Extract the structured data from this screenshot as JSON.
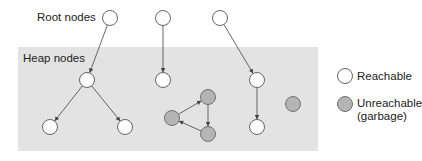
{
  "diagram": {
    "labels": {
      "root_nodes": "Root nodes",
      "heap_nodes": "Heap nodes"
    },
    "legend": {
      "reachable": "Reachable",
      "unreachable_line1": "Unreachable",
      "unreachable_line2": "(garbage)"
    },
    "colors": {
      "reachable_fill": "#ffffff",
      "unreachable_fill": "#b4b4b4",
      "heap_background": "#e3e3e3",
      "stroke": "#555555"
    },
    "nodes": [
      {
        "id": "r1",
        "type": "root",
        "reachable": true,
        "x": 110,
        "y": 18
      },
      {
        "id": "r2",
        "type": "root",
        "reachable": true,
        "x": 163,
        "y": 18
      },
      {
        "id": "r3",
        "type": "root",
        "reachable": true,
        "x": 220,
        "y": 18
      },
      {
        "id": "h1",
        "type": "heap",
        "reachable": true,
        "x": 87,
        "y": 80
      },
      {
        "id": "h2",
        "type": "heap",
        "reachable": true,
        "x": 50,
        "y": 127
      },
      {
        "id": "h3",
        "type": "heap",
        "reachable": true,
        "x": 125,
        "y": 127
      },
      {
        "id": "h4",
        "type": "heap",
        "reachable": true,
        "x": 163,
        "y": 80
      },
      {
        "id": "h5",
        "type": "heap",
        "reachable": true,
        "x": 257,
        "y": 80
      },
      {
        "id": "h6",
        "type": "heap",
        "reachable": true,
        "x": 257,
        "y": 127
      },
      {
        "id": "g1",
        "type": "heap",
        "reachable": false,
        "x": 208,
        "y": 97
      },
      {
        "id": "g2",
        "type": "heap",
        "reachable": false,
        "x": 172,
        "y": 118
      },
      {
        "id": "g3",
        "type": "heap",
        "reachable": false,
        "x": 208,
        "y": 134
      },
      {
        "id": "g4",
        "type": "heap",
        "reachable": false,
        "x": 293,
        "y": 104
      }
    ],
    "edges": [
      {
        "from": "r1",
        "to": "h1"
      },
      {
        "from": "r2",
        "to": "h4"
      },
      {
        "from": "r3",
        "to": "h5"
      },
      {
        "from": "h1",
        "to": "h2"
      },
      {
        "from": "h1",
        "to": "h3"
      },
      {
        "from": "h5",
        "to": "h6"
      },
      {
        "from": "g2",
        "to": "g1"
      },
      {
        "from": "g1",
        "to": "g3"
      },
      {
        "from": "g3",
        "to": "g2"
      }
    ]
  }
}
